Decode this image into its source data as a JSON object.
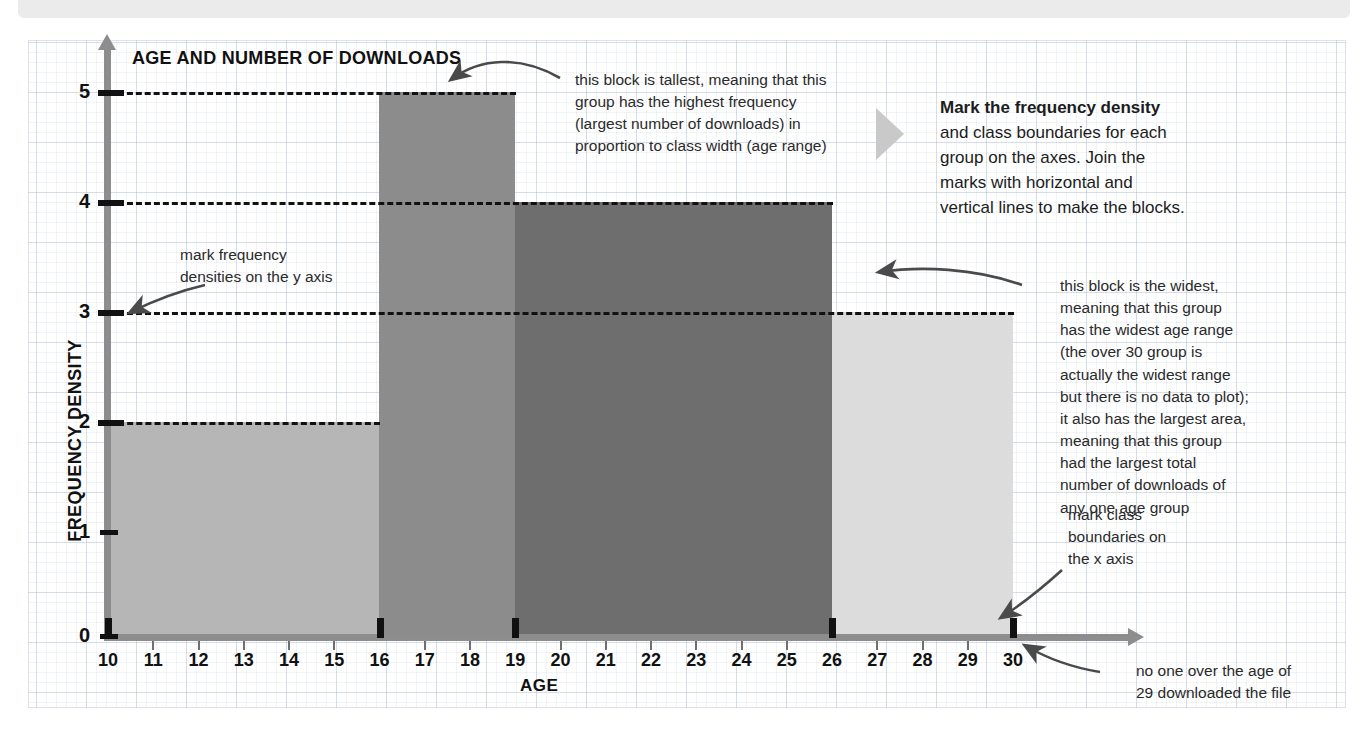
{
  "chart_data": {
    "type": "bar",
    "title": "AGE AND NUMBER OF DOWNLOADS",
    "xlabel": "AGE",
    "ylabel": "FREQUENCY DENSITY",
    "xlim": [
      10,
      30
    ],
    "ylim": [
      0,
      5
    ],
    "grid": true,
    "legend": "none",
    "x_ticks": [
      "10",
      "11",
      "12",
      "13",
      "14",
      "15",
      "16",
      "17",
      "18",
      "19",
      "20",
      "21",
      "22",
      "23",
      "24",
      "25",
      "26",
      "27",
      "28",
      "29",
      "30"
    ],
    "y_ticks": [
      "0",
      "1",
      "2",
      "3",
      "4",
      "5"
    ],
    "class_boundaries": [
      10,
      16,
      19,
      26,
      30
    ],
    "bins": [
      {
        "label": "10-16",
        "start": 10,
        "end": 16,
        "frequency_density": 2,
        "class_width": 6,
        "frequency": 12,
        "color": "#b6b6b6"
      },
      {
        "label": "16-19",
        "start": 16,
        "end": 19,
        "frequency_density": 5,
        "class_width": 3,
        "frequency": 15,
        "color": "#8c8c8c"
      },
      {
        "label": "19-26",
        "start": 19,
        "end": 26,
        "frequency_density": 4,
        "class_width": 7,
        "frequency": 28,
        "color": "#6e6e6e"
      },
      {
        "label": "26-30",
        "start": 26,
        "end": 30,
        "frequency_density": 3,
        "class_width": 4,
        "frequency": 12,
        "color": "#dcdcdc"
      }
    ]
  },
  "annotations": {
    "y_axis_note": "mark frequency\ndensities on the y axis",
    "y_axis_note_lines": [
      "mark frequency",
      "densities on the y axis"
    ],
    "tallest_block_note_lines": [
      "this block is tallest, meaning that this",
      "group has the highest frequency",
      "(largest number of downloads) in",
      "proportion to class width (age range)"
    ],
    "widest_block_note_lines": [
      "this block is the widest,",
      "meaning that this group",
      "has the widest age range",
      "(the over 30 group is",
      "actually the widest range",
      "but there is no data to plot);",
      "it also has the largest area,",
      "meaning that this group",
      "had the largest total",
      "number of downloads of",
      "any one age group"
    ],
    "class_boundaries_note_lines": [
      "mark class",
      "boundaries on",
      "the x axis"
    ],
    "no_data_note_lines": [
      "no one over the age of",
      "29 downloaded the file"
    ]
  },
  "callout": {
    "bold_text": "Mark the frequency density",
    "rest_text": " and class boundaries for each group on the axes. Join the marks with horizontal and vertical lines to make the blocks.",
    "arrow_icon": "triangle-right-icon"
  },
  "colors": {
    "axis": "#8d8d8d",
    "tick": "#111111",
    "grid_major": "#96aac8",
    "bar_1": "#b6b6b6",
    "bar_2": "#8c8c8c",
    "bar_3": "#6e6e6e",
    "bar_4": "#dcdcdc",
    "callout_arrow": "#c9c9c9",
    "top_band": "#ebebeb"
  }
}
